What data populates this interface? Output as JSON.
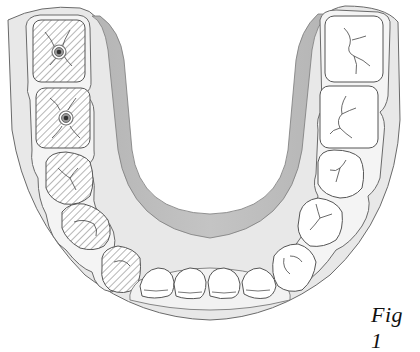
{
  "figure": {
    "label": "Fig 1",
    "colors": {
      "outline": "#555555",
      "gingiva_outer": "#e6e6e6",
      "gingiva_inner": "#b9b9b9",
      "tooth_fill": "#ffffff",
      "hatch": "#777777",
      "implant_ring": "#888888",
      "implant_core": "#333333"
    }
  },
  "teeth": {
    "left_hatched": [
      {
        "id": "left-molar-1",
        "implant": true
      },
      {
        "id": "left-molar-2",
        "implant": true
      },
      {
        "id": "left-premolar-1",
        "implant": false
      },
      {
        "id": "left-premolar-2",
        "implant": false
      },
      {
        "id": "left-canine",
        "implant": false
      }
    ],
    "incisors": [
      "incisor-1",
      "incisor-2",
      "incisor-3",
      "incisor-4"
    ],
    "right_plain": [
      "right-canine",
      "right-premolar-1",
      "right-premolar-2",
      "right-molar-2",
      "right-molar-1"
    ]
  }
}
